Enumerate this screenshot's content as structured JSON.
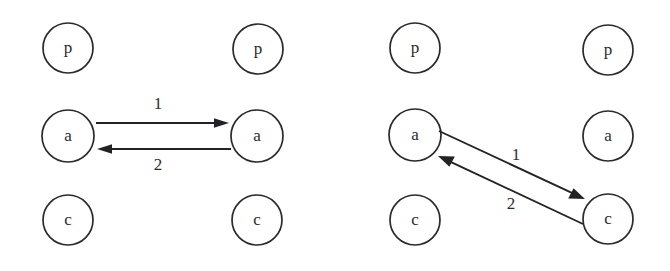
{
  "figure": {
    "background_color": "#ffffff",
    "stroke_color": "#232327",
    "node_stroke_color": "#2a2a2e",
    "text_color": "#2b2b30",
    "width": 670,
    "height": 271
  },
  "panels": [
    {
      "id": "left-panel",
      "name": "parallel-mapping-panel",
      "nodes": [
        {
          "id": "L-left-p",
          "label": "p",
          "cx": 68,
          "cy": 48,
          "r": 25,
          "column": "left",
          "row": "top"
        },
        {
          "id": "L-left-a",
          "label": "a",
          "cx": 68,
          "cy": 136,
          "r": 26,
          "column": "left",
          "row": "middle"
        },
        {
          "id": "L-left-c",
          "label": "c",
          "cx": 68,
          "cy": 220,
          "r": 25,
          "column": "left",
          "row": "bottom"
        },
        {
          "id": "L-right-p",
          "label": "p",
          "cx": 258,
          "cy": 49,
          "r": 25,
          "column": "right",
          "row": "top"
        },
        {
          "id": "L-right-a",
          "label": "a",
          "cx": 257,
          "cy": 136,
          "r": 26,
          "column": "right",
          "row": "middle"
        },
        {
          "id": "L-right-c",
          "label": "c",
          "cx": 257,
          "cy": 220,
          "r": 25,
          "column": "right",
          "row": "bottom"
        }
      ],
      "edges": [
        {
          "id": "L-edge-1",
          "label": "1",
          "from": "L-left-a",
          "to": "L-right-a",
          "x1": 96,
          "y1": 123,
          "x2": 229,
          "y2": 123,
          "label_x": 158,
          "label_y": 105
        },
        {
          "id": "L-edge-2",
          "label": "2",
          "from": "L-right-a",
          "to": "L-left-a",
          "x1": 231,
          "y1": 149,
          "x2": 97,
          "y2": 149,
          "label_x": 158,
          "label_y": 166
        }
      ]
    },
    {
      "id": "right-panel",
      "name": "crossing-mapping-panel",
      "nodes": [
        {
          "id": "R-left-p",
          "label": "p",
          "cx": 415,
          "cy": 48,
          "r": 25,
          "column": "left",
          "row": "top"
        },
        {
          "id": "R-left-a",
          "label": "a",
          "cx": 415,
          "cy": 135,
          "r": 26,
          "column": "left",
          "row": "middle"
        },
        {
          "id": "R-left-c",
          "label": "c",
          "cx": 415,
          "cy": 220,
          "r": 25,
          "column": "left",
          "row": "bottom"
        },
        {
          "id": "R-right-p",
          "label": "p",
          "cx": 608,
          "cy": 50,
          "r": 25,
          "column": "right",
          "row": "top"
        },
        {
          "id": "R-right-a",
          "label": "a",
          "cx": 608,
          "cy": 136,
          "r": 25,
          "column": "right",
          "row": "middle"
        },
        {
          "id": "R-right-c",
          "label": "c",
          "cx": 608,
          "cy": 219,
          "r": 25,
          "column": "right",
          "row": "bottom"
        }
      ],
      "edges": [
        {
          "id": "R-edge-1",
          "label": "1",
          "from": "R-left-a",
          "to": "R-right-c",
          "x1": 439,
          "y1": 131,
          "x2": 585,
          "y2": 199,
          "label_x": 516,
          "label_y": 156
        },
        {
          "id": "R-edge-2",
          "label": "2",
          "from": "R-right-c",
          "to": "R-left-a",
          "x1": 583,
          "y1": 224,
          "x2": 438,
          "y2": 156,
          "label_x": 511,
          "label_y": 205
        }
      ]
    }
  ]
}
